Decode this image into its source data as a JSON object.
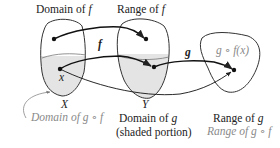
{
  "diagram": {
    "type": "function-composition",
    "colors": {
      "stroke": "#333333",
      "shading": "#e4e4e4",
      "gray_text": "#8a8a8a",
      "text": "#222222"
    },
    "top_labels": {
      "domain_f_prefix": "Domain of ",
      "domain_f_var": "f",
      "range_f_prefix": "Range of ",
      "range_f_var": "f"
    },
    "arrow_labels": {
      "f": "f",
      "g": "g"
    },
    "points": {
      "x": "x",
      "gfx": "g ∘ f(x)"
    },
    "set_labels": {
      "X": "X",
      "Y": "Y"
    },
    "bottom_labels": {
      "domain_gf_prefix": "Domain of ",
      "domain_gf_expr": "g ∘ f",
      "domain_g_prefix": "Domain of ",
      "domain_g_var": "g",
      "shaded_portion": "(shaded portion)",
      "range_g_prefix": "Range of ",
      "range_g_var": "g",
      "range_gf_prefix": "Range of ",
      "range_gf_expr": "g ∘ f"
    }
  }
}
